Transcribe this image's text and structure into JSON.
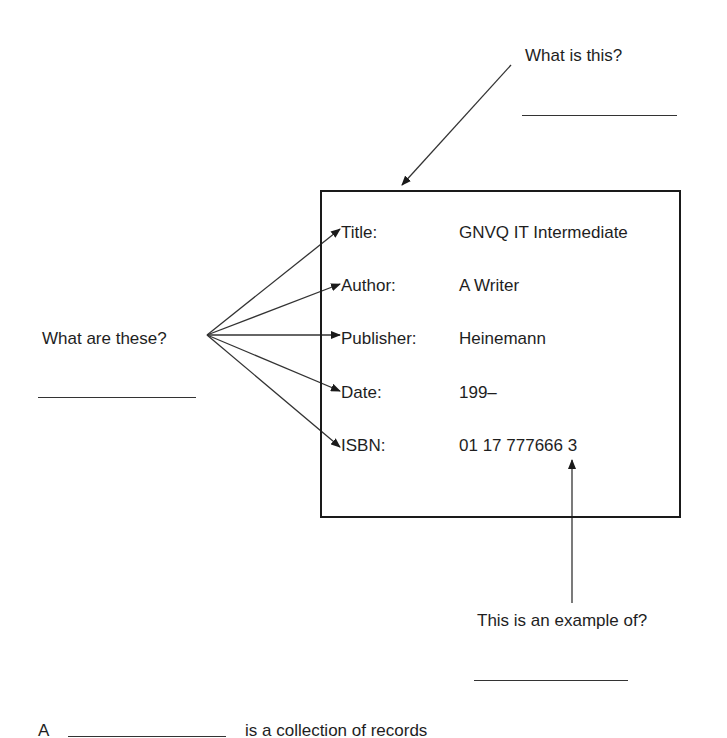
{
  "record": {
    "fields": [
      {
        "label": "Title:",
        "value": "GNVQ IT Intermediate"
      },
      {
        "label": "Author:",
        "value": "A Writer"
      },
      {
        "label": "Publisher:",
        "value": "Heinemann"
      },
      {
        "label": "Date:",
        "value": "199–"
      },
      {
        "label": "ISBN:",
        "value": "01 17 777666 3"
      }
    ]
  },
  "questions": {
    "box_question": "What is this?",
    "fields_question": "What are these?",
    "value_question": "This is an example of?",
    "sentence_prefix": "A",
    "sentence_suffix": "is a collection of records"
  },
  "colors": {
    "ink": "#1e1e1e",
    "background": "#ffffff"
  }
}
